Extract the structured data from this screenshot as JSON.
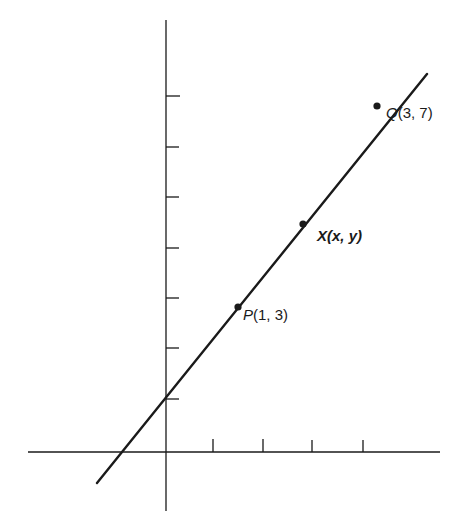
{
  "figure": {
    "axes": {
      "x_ticks_count": 4,
      "y_ticks_count": 7,
      "tick_labels_shown": false
    },
    "points": [
      {
        "name": "P",
        "label_letter": "P",
        "label_coords": "(1, 3)",
        "x": 1,
        "y": 3
      },
      {
        "name": "X",
        "label_letter": "X",
        "label_coords": "(x, y)",
        "x": "x",
        "y": "y"
      },
      {
        "name": "Q",
        "label_letter": "Q",
        "label_coords": "(3, 7)",
        "x": 3,
        "y": 7
      }
    ],
    "line": {
      "slope": 2,
      "y_intercept": 1
    },
    "colors": {
      "ink": "#1a1a1a",
      "background": "#ffffff"
    }
  }
}
